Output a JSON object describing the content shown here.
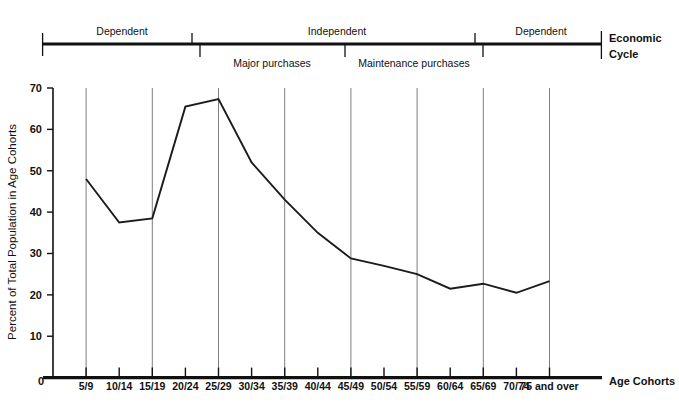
{
  "chart_data": {
    "type": "line",
    "title": "",
    "xlabel": "Age Cohorts",
    "ylabel": "Percent of Total Population in Age Cohorts",
    "ylim": [
      0,
      70
    ],
    "ytick_values": [
      0,
      10,
      20,
      30,
      40,
      50,
      60,
      70
    ],
    "ytick_labels": [
      "0",
      "10",
      "20",
      "30",
      "40",
      "50",
      "60",
      "70"
    ],
    "grid": "vertical-only",
    "legend": "none",
    "categories": [
      "5/9",
      "10/14",
      "15/19",
      "20/24",
      "25/29",
      "30/34",
      "35/39",
      "40/44",
      "45/49",
      "50/54",
      "55/59",
      "60/64",
      "65/69",
      "70/74",
      "75 and over"
    ],
    "origin_label": "0",
    "values": [
      48,
      37.5,
      38.5,
      65.5,
      67.3,
      52,
      43,
      35,
      28.8,
      27,
      25,
      21.5,
      22.7,
      20.5,
      23.3
    ],
    "gridline_categories": [
      "5/9",
      "15/19",
      "25/29",
      "35/39",
      "45/49",
      "55/59",
      "65/69",
      "75 and over"
    ],
    "annotations": {
      "cycle_bands": [
        {
          "label": "Dependent",
          "start": "0",
          "end": "15/19",
          "position": "above"
        },
        {
          "label": "Independent",
          "start": "15/19",
          "end": "65/69",
          "position": "above"
        },
        {
          "label": "Dependent",
          "start": "65/69",
          "end": "75 and over",
          "position": "above"
        },
        {
          "label": "Major purchases",
          "start": "15/19",
          "end": "35/39",
          "position": "below"
        },
        {
          "label": "Maintenance purchases",
          "start": "35/39",
          "end": "65/69",
          "position": "below"
        }
      ],
      "cycle_axis_label_line1": "Economic",
      "cycle_axis_label_line2": "Cycle"
    }
  }
}
